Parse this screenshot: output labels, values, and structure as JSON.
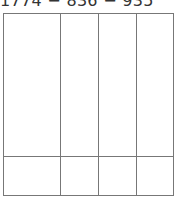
{
  "expression": {
    "text": "1774 − 836 − 935"
  },
  "grid": {
    "columns": 4,
    "rows": 2,
    "column_boundaries_px": [
      0,
      57,
      95,
      133,
      171
    ],
    "row_boundaries_px": [
      0,
      143,
      183
    ],
    "line_color": "#777777"
  }
}
